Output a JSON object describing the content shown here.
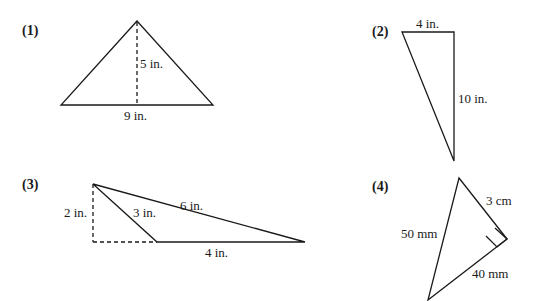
{
  "problems": [
    {
      "number": "(1)",
      "shape": "triangle with dashed altitude",
      "labels": {
        "height": "5 in.",
        "base": "9 in."
      }
    },
    {
      "number": "(2)",
      "shape": "right triangle",
      "labels": {
        "top": "4 in.",
        "side": "10 in."
      }
    },
    {
      "number": "(3)",
      "shape": "obtuse triangle with external dashed altitude",
      "labels": {
        "height": "2 in.",
        "inner_side": "3 in.",
        "long_side": "6 in.",
        "base": "4 in."
      }
    },
    {
      "number": "(4)",
      "shape": "right triangle with right-angle mark",
      "labels": {
        "short_leg": "3 cm",
        "hypotenuse": "50 mm",
        "long_leg": "40 mm"
      }
    }
  ],
  "colors": {
    "stroke": "#1a1a1a",
    "background": "#ffffff"
  }
}
